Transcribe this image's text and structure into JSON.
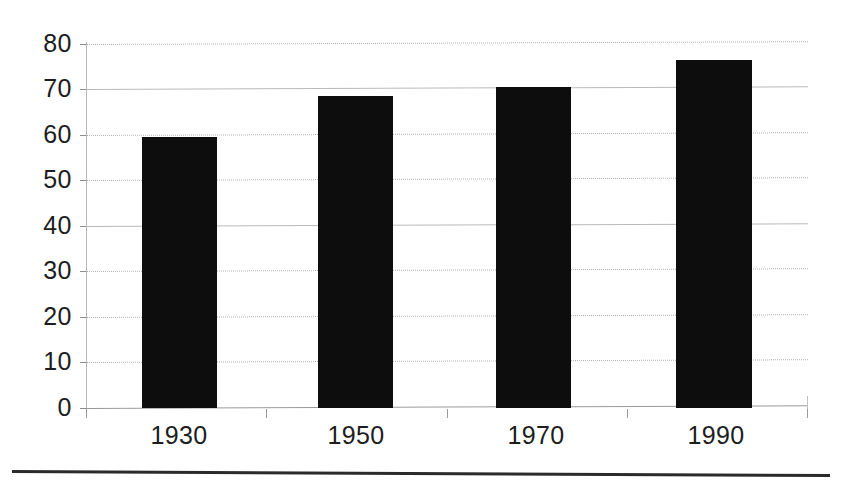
{
  "chart_data": {
    "type": "bar",
    "title": "",
    "subtitle": "",
    "xlabel": "",
    "ylabel": "",
    "categories": [
      "1930",
      "1950",
      "1970",
      "1990"
    ],
    "values": [
      59.5,
      68.5,
      70.5,
      76.5
    ],
    "series": [
      {
        "name": "",
        "values": [
          59.5,
          68.5,
          70.5,
          76.5
        ]
      }
    ],
    "ylim": [
      0,
      80
    ],
    "ytick_labels": [
      "0",
      "10",
      "20",
      "30",
      "40",
      "50",
      "60",
      "70",
      "80"
    ],
    "ytick_values": [
      0,
      10,
      20,
      30,
      40,
      50,
      60,
      70,
      80
    ],
    "grid": true,
    "grid_axis": "y",
    "grid_styles": [
      "solid",
      "dotted",
      "dotted",
      "dotted",
      "solid",
      "dotted",
      "dotted",
      "solid",
      "dotted"
    ],
    "legend": false,
    "legend_position": "none",
    "bar_color": "#0d0d0d",
    "grid_color": "#b5b5b5",
    "axis_color": "#9a9a9a",
    "text_color": "#1d1d1d",
    "background": "#ffffff",
    "annotations": []
  },
  "figure": {
    "bottom_rule_visible": true
  }
}
